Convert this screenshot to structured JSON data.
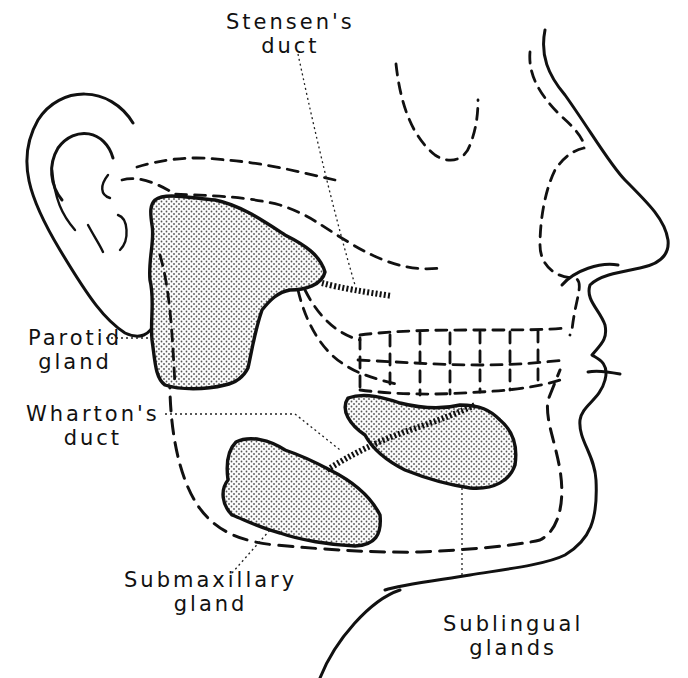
{
  "figure": {
    "labels": {
      "stensens_duct": [
        "Stensen's",
        "duct"
      ],
      "parotid_gland": [
        "Parotid",
        "gland"
      ],
      "whartons_duct": [
        "Wharton's",
        "duct"
      ],
      "submaxillary_gland": [
        "Submaxillary",
        "gland"
      ],
      "sublingual_glands": [
        "Sublingual",
        "glands"
      ]
    },
    "colors": {
      "ink": "#111111",
      "stipple": "#555555",
      "background": "#ffffff"
    }
  }
}
